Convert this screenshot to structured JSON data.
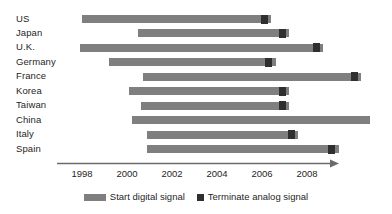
{
  "chart_data": {
    "type": "bar",
    "subtype": "horizontal-range-gantt",
    "title": "",
    "xlabel": "",
    "ylabel": "",
    "xlim": [
      1996.8,
      2010.8
    ],
    "grid": false,
    "legend_position": "bottom-center",
    "x_ticks": [
      1998,
      2000,
      2002,
      2004,
      2006,
      2008
    ],
    "tick_labels": [
      "1998",
      "2000",
      "2002",
      "2004",
      "2006",
      "2008"
    ],
    "categories": [
      "US",
      "Japan",
      "U.K.",
      "Germany",
      "France",
      "Korea",
      "Taiwan",
      "China",
      "Italy",
      "Spain"
    ],
    "series": [
      {
        "name": "Start digital signal",
        "color": "#7f7f7f",
        "values": [
          1998.0,
          2000.5,
          1997.9,
          1999.2,
          2000.7,
          2000.1,
          2000.6,
          2000.2,
          2000.9,
          2000.9
        ]
      },
      {
        "name": "Terminate analog signal",
        "color": "#2f2f2f",
        "values": [
          2006.1,
          2006.9,
          2008.4,
          2006.3,
          2010.1,
          2006.9,
          2006.9,
          null,
          2007.3,
          2009.1
        ]
      }
    ],
    "bar_end": [
      2006.4,
      2007.2,
      2008.7,
      2006.6,
      2010.4,
      2007.2,
      2007.2,
      2010.8,
      2007.6,
      2009.4
    ]
  },
  "legend": {
    "items": [
      {
        "label": "Start digital signal",
        "marker": "bar-swatch"
      },
      {
        "label": "Terminate analog signal",
        "marker": "square-swatch"
      }
    ]
  }
}
